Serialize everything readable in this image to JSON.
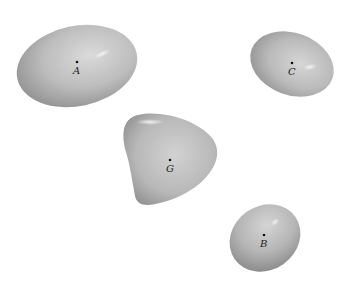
{
  "diagram": {
    "title": "",
    "background": "#ffffff",
    "bodies": [
      {
        "id": "A",
        "label": "A",
        "shape": "ellipsoid",
        "cx": 77,
        "cy": 66,
        "rx": 61,
        "ry": 40,
        "rotate": -12,
        "dot": [
          77,
          62
        ],
        "label_pos": [
          73,
          74
        ]
      },
      {
        "id": "C",
        "label": "C",
        "shape": "ellipsoid",
        "cx": 292,
        "cy": 64,
        "rx": 43,
        "ry": 31,
        "rotate": 20,
        "dot": [
          292,
          63
        ],
        "label_pos": [
          288,
          75
        ]
      },
      {
        "id": "G",
        "label": "G",
        "shape": "rounded-triangle",
        "dot": [
          170,
          160
        ],
        "label_pos": [
          166,
          172
        ]
      },
      {
        "id": "B",
        "label": "B",
        "shape": "ellipsoid",
        "cx": 265,
        "cy": 238,
        "rx": 37,
        "ry": 32,
        "rotate": -35,
        "dot": [
          264,
          235
        ],
        "label_pos": [
          260,
          247
        ]
      }
    ],
    "colors": {
      "body_light": "#d4d4d4",
      "body_mid": "#b0b0b0",
      "body_dark": "#8a8a8a",
      "highlight": "#efefef",
      "label": "#222222"
    }
  }
}
